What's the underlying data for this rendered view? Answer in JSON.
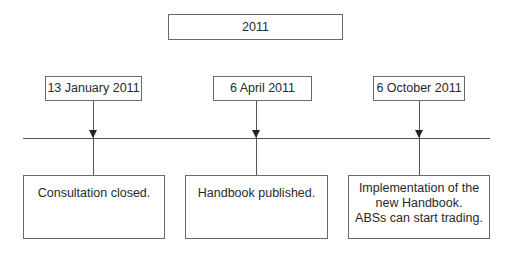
{
  "diagram": {
    "type": "timeline",
    "year_label": "2011",
    "events": [
      {
        "date": "13 January 2011",
        "description": [
          "Consultation closed."
        ]
      },
      {
        "date": "6 April 2011",
        "description": [
          "Handbook published."
        ]
      },
      {
        "date": "6 October 2011",
        "description": [
          "Implementation of the",
          "new Handbook.",
          "ABSs can start trading."
        ]
      }
    ],
    "colors": {
      "line": "#555555",
      "border": "#6a6a6a",
      "arrow": "#222222",
      "text": "#2a2a2a",
      "background": "#ffffff"
    }
  }
}
